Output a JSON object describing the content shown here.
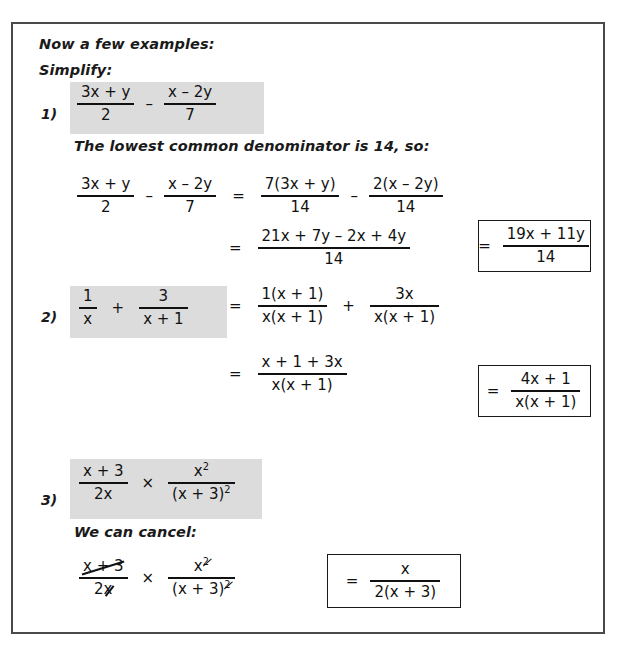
{
  "page": {
    "intro_line_1": "Now a few examples:",
    "intro_line_2": "Simplify:"
  },
  "examples": [
    {
      "marker": "1)",
      "problem": {
        "frac1": {
          "num": "3x + y",
          "den": "2"
        },
        "operator": "–",
        "frac2": {
          "num": "x – 2y",
          "den": "7"
        }
      },
      "note": "The lowest common denominator is 14, so:",
      "steps": [
        {
          "lhs": {
            "frac1": {
              "num": "3x + y",
              "den": "2"
            },
            "operator": "–",
            "frac2": {
              "num": "x – 2y",
              "den": "7"
            }
          },
          "equals": "=",
          "rhs": {
            "frac1": {
              "num": "7(3x + y)",
              "den": "14"
            },
            "operator": "–",
            "frac2": {
              "num": "2(x – 2y)",
              "den": "14"
            }
          }
        },
        {
          "equals": "=",
          "frac": {
            "num": "21x + 7y – 2x + 4y",
            "den": "14"
          }
        }
      ],
      "answer": {
        "equals": "=",
        "frac": {
          "num": "19x + 11y",
          "den": "14"
        }
      }
    },
    {
      "marker": "2)",
      "problem": {
        "frac1": {
          "num": "1",
          "den": "x"
        },
        "operator": "+",
        "frac2": {
          "num": "3",
          "den": "x + 1"
        }
      },
      "steps": [
        {
          "equals": "=",
          "frac1": {
            "num": "1(x + 1)",
            "den": "x(x + 1)"
          },
          "operator": "+",
          "frac2": {
            "num": "3x",
            "den": "x(x + 1)"
          }
        },
        {
          "equals": "=",
          "frac": {
            "num": "x + 1 + 3x",
            "den": "x(x + 1)"
          }
        }
      ],
      "answer": {
        "equals": "=",
        "frac": {
          "num": "4x + 1",
          "den": "x(x + 1)"
        }
      }
    },
    {
      "marker": "3)",
      "problem": {
        "frac1": {
          "num": "x + 3",
          "den": "2x"
        },
        "operator": "×",
        "frac2": {
          "num_base": "x",
          "num_sup": "2",
          "den_base": "(x + 3)",
          "den_sup": "2"
        }
      },
      "note": "We can cancel:",
      "cancel_step": {
        "frac1": {
          "num": "x + 3",
          "den": "2x"
        },
        "operator": "×",
        "frac2": {
          "num_base": "x",
          "num_sup": "2",
          "den_base": "(x + 3)",
          "den_sup": "2"
        }
      },
      "answer": {
        "equals": "=",
        "frac": {
          "num": "x",
          "den": "2(x + 3)"
        }
      }
    }
  ],
  "colors": {
    "highlight": "#dcdcdc",
    "border": "#4a4a4a",
    "ink": "#111111"
  }
}
